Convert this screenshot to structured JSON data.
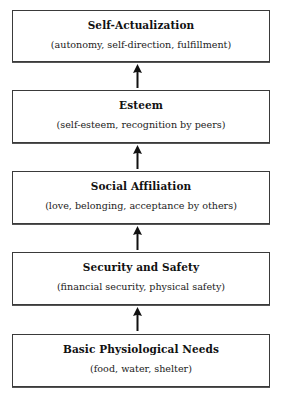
{
  "diagram": {
    "type": "hierarchy",
    "direction": "bottom-to-top",
    "levels": [
      {
        "title": "Self-Actualization",
        "description": "(autonomy, self-direction, fulfillment)"
      },
      {
        "title": "Esteem",
        "description": "(self-esteem, recognition by peers)"
      },
      {
        "title": "Social Affiliation",
        "description": "(love, belonging, acceptance by others)"
      },
      {
        "title": "Security and Safety",
        "description": "(financial security, physical safety)"
      },
      {
        "title": "Basic Physiological Needs",
        "description": "(food, water, shelter)"
      }
    ],
    "arrows": [
      {
        "from": "Esteem",
        "to": "Self-Actualization"
      },
      {
        "from": "Social Affiliation",
        "to": "Esteem"
      },
      {
        "from": "Security and Safety",
        "to": "Social Affiliation"
      },
      {
        "from": "Basic Physiological Needs",
        "to": "Security and Safety"
      }
    ],
    "colors": {
      "border": "#3a3a3a",
      "text": "#1a1a1a",
      "arrow": "#111111",
      "background": "#ffffff"
    }
  }
}
